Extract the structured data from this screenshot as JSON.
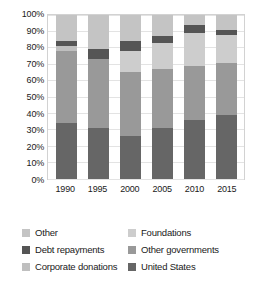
{
  "chart_data": {
    "type": "bar",
    "subtype": "100% stacked bar",
    "title": "",
    "subtitle": "",
    "xlabel": "",
    "ylabel": "",
    "ylim": [
      0,
      100
    ],
    "yticks": [
      "0%",
      "10%",
      "20%",
      "30%",
      "40%",
      "50%",
      "60%",
      "70%",
      "80%",
      "90%",
      "100%"
    ],
    "grid": true,
    "legend_position": "bottom",
    "legend_columns": 2,
    "categories": [
      "1990",
      "1995",
      "2000",
      "2005",
      "2010",
      "2015"
    ],
    "stack_order_bottom_to_top": [
      "United States",
      "Other governments",
      "Foundations",
      "Corporate donations",
      "Debt repayments",
      "Other"
    ],
    "series": [
      {
        "name": "United States",
        "color": "#666666",
        "values": [
          34,
          31,
          26,
          31,
          36,
          39
        ]
      },
      {
        "name": "Other governments",
        "color": "#999999",
        "values": [
          44,
          42,
          39,
          36,
          33,
          32
        ]
      },
      {
        "name": "Foundations",
        "color": "#cdcdcd",
        "values": [
          0,
          0,
          13,
          16,
          20,
          17
        ]
      },
      {
        "name": "Corporate donations",
        "color": "#bfbfbf",
        "values": [
          3,
          0,
          0,
          0,
          0,
          0
        ]
      },
      {
        "name": "Debt repayments",
        "color": "#555555",
        "values": [
          3,
          6,
          6,
          4,
          5,
          3
        ]
      },
      {
        "name": "Other",
        "color": "#c4c4c4",
        "values": [
          16,
          21,
          16,
          13,
          6,
          9
        ]
      }
    ]
  },
  "legend": {
    "rows": [
      {
        "left": {
          "label": "Other",
          "color": "#c4c4c4"
        },
        "right": {
          "label": "Foundations",
          "color": "#cdcdcd"
        }
      },
      {
        "left": {
          "label": "Debt repayments",
          "color": "#555555"
        },
        "right": {
          "label": "Other governments",
          "color": "#999999"
        }
      },
      {
        "left": {
          "label": "Corporate donations",
          "color": "#bfbfbf"
        },
        "right": {
          "label": "United States",
          "color": "#666666"
        }
      }
    ]
  }
}
